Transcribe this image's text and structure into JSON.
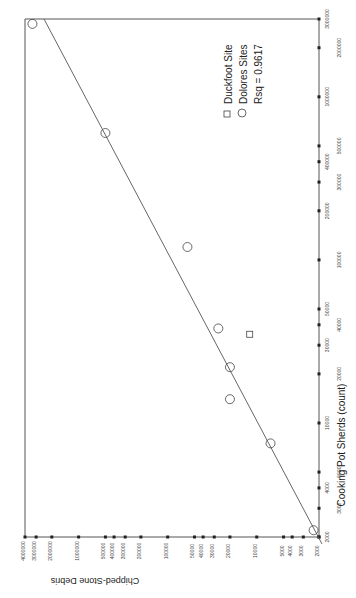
{
  "chart_data": {
    "type": "scatter",
    "title": "",
    "orientation": "rotated-90-ccw",
    "xlabel": "Cooking Pot Sherds (count)",
    "ylabel": "Chipped-Stone Debris",
    "xscale": "log",
    "yscale": "log",
    "xlim": [
      2000,
      3000000
    ],
    "ylim": [
      2000,
      4000000
    ],
    "x_ticks": [
      "2000",
      "3000",
      "4000",
      "5000",
      "10000",
      "20000",
      "30000",
      "40000",
      "50000",
      "100000",
      "200000",
      "300000",
      "400000",
      "500000",
      "1000000",
      "2000000",
      "3000000"
    ],
    "y_ticks": [
      "2000",
      "3000",
      "4000",
      "5000",
      "10000",
      "20000",
      "30000",
      "40000",
      "50000",
      "100000",
      "200000",
      "300000",
      "400000",
      "500000",
      "1000000",
      "2000000",
      "3000000",
      "4000000"
    ],
    "legend": [
      {
        "label": "Duckfoot  Site",
        "marker": "square"
      },
      {
        "label": "Dolores Sites",
        "marker": "circle"
      },
      {
        "label": "Rsq = 0.9617",
        "marker": "none"
      }
    ],
    "series": [
      {
        "name": "Duckfoot Site",
        "marker": "square",
        "points": [
          {
            "x": 35000,
            "y": 12000
          }
        ]
      },
      {
        "name": "Dolores Sites",
        "marker": "circle",
        "points": [
          {
            "x": 2200,
            "y": 2300
          },
          {
            "x": 7500,
            "y": 7000
          },
          {
            "x": 14000,
            "y": 20000
          },
          {
            "x": 22000,
            "y": 20000
          },
          {
            "x": 38000,
            "y": 27000
          },
          {
            "x": 120000,
            "y": 60000
          },
          {
            "x": 600000,
            "y": 500000
          },
          {
            "x": 2800000,
            "y": 3300000
          }
        ]
      }
    ],
    "fit_line": {
      "type": "linear (log-log)",
      "rsq": 0.9617
    },
    "grid": false
  }
}
